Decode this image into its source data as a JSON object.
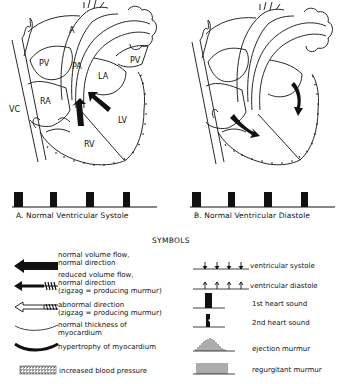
{
  "panels": [
    {
      "id": "A",
      "caption": "A.  Normal Ventricular Systole",
      "labels": {
        "A": "A",
        "PA": "PA",
        "PV_left": "PV",
        "PV_right": "PV",
        "LA": "LA",
        "RA": "RA",
        "LV": "LV",
        "RV": "RV",
        "VC": "VC"
      }
    },
    {
      "id": "B",
      "caption": "B.  Normal Ventricular Diastole"
    }
  ],
  "symbols_title": "SYMBOLS",
  "legend_left": [
    {
      "icon": "normal-flow-arrow",
      "text": [
        "normal volume flow,",
        "normal direction"
      ]
    },
    {
      "icon": "reduced-flow-arrow",
      "text": [
        "reduced volume flow,",
        "normal direction",
        "(zigzag = producing murmur)"
      ]
    },
    {
      "icon": "abnormal-direction-arrow",
      "text": [
        "abnormal direction",
        "(zigzag = producing murmur)"
      ]
    },
    {
      "icon": "thin-myocardium-line",
      "text": [
        "normal thickness of",
        "myocardium"
      ]
    },
    {
      "icon": "thick-myocardium-line",
      "text": [
        "hypertrophy of myocardium"
      ]
    },
    {
      "icon": "hatched-pressure-box",
      "text": [
        "increased blood pressure"
      ]
    }
  ],
  "legend_right": [
    {
      "icon": "systole-ticks",
      "text": "ventricular systole"
    },
    {
      "icon": "diastole-ticks",
      "text": "ventricular diastole"
    },
    {
      "icon": "first-heart-sound",
      "text": "1st heart sound"
    },
    {
      "icon": "second-heart-sound",
      "text": "2nd heart sound"
    },
    {
      "icon": "ejection-murmur",
      "text": "ejection murmur"
    },
    {
      "icon": "regurgitant-murmur",
      "text": "regurgitant murmur"
    }
  ]
}
